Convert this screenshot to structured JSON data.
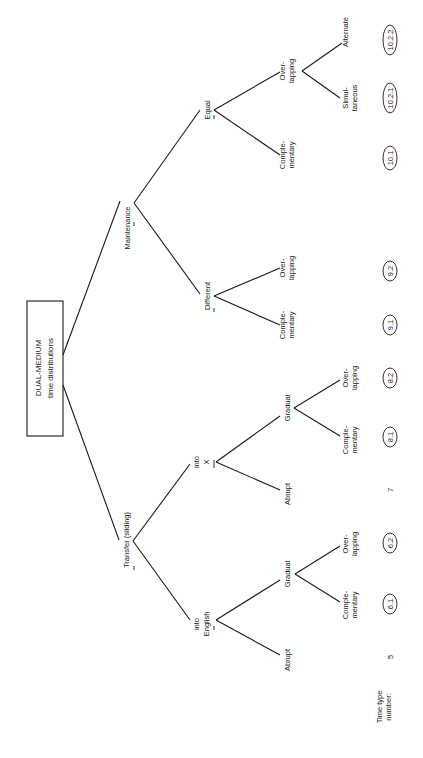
{
  "diagram": {
    "orientation": "rotated -90deg (read with page turned clockwise)",
    "root": {
      "line1": "DUAL-MEDIUM",
      "line2": "time distributions"
    },
    "level1": {
      "transfer": "Transfer (sliding)",
      "maintenance": "Maintenance"
    },
    "level2": {
      "into_english": {
        "line1": "into",
        "line2": "English"
      },
      "into_x": {
        "line1": "into",
        "line2": "X"
      },
      "different": "Different",
      "equal": "Equal"
    },
    "level3": {
      "eng_abrupt": "Abrupt",
      "eng_gradual": "Gradual",
      "x_abrupt": "Abrupt",
      "x_gradual": "Gradual",
      "diff_comp": {
        "line1": "Comple-",
        "line2": "mentary"
      },
      "diff_over": {
        "line1": "Over-",
        "line2": "lapping"
      },
      "eq_comp": {
        "line1": "Comple-",
        "line2": "mentary"
      },
      "eq_over": {
        "line1": "Over-",
        "line2": "lapping"
      }
    },
    "level4": {
      "eng_grad_comp": {
        "line1": "Comple-",
        "line2": "mentary"
      },
      "eng_grad_over": {
        "line1": "Over-",
        "line2": "lapping"
      },
      "x_grad_comp": {
        "line1": "Comple-",
        "line2": "mentary"
      },
      "x_grad_over": {
        "line1": "Over-",
        "line2": "lapping"
      },
      "eq_over_simul": {
        "line1": "Simul-",
        "line2": "taneous"
      },
      "eq_over_alt": "Alternate"
    },
    "time_type": {
      "label_line1": "Time type",
      "label_line2": "number:",
      "numbers": [
        "5",
        "6.1",
        "6.2",
        "7",
        "8.1",
        "8.2",
        "9.1",
        "9.2",
        "10.1",
        "10.2.1",
        "10.2.2"
      ]
    }
  }
}
